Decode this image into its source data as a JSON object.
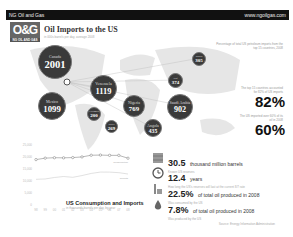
{
  "header": {
    "brand": "NG Oil and Gas",
    "url": "www.ngoilgas.com",
    "logo": "O&G",
    "logo_sub": "NG OIL AND GAS",
    "title": "Oil Imports to the US",
    "subtitle": "in 000s barrels per day, average 2008"
  },
  "map": {
    "note": "Percentage of total US petroleum imports from the top 15 countries, 2008",
    "bubbles": [
      {
        "country": "Canada",
        "value": 2001,
        "x": 28,
        "y": 5,
        "size": 34
      },
      {
        "country": "Venezuela",
        "value": 1119,
        "x": 80,
        "y": 35,
        "size": 27
      },
      {
        "country": "Mexico",
        "value": 1099,
        "x": 28,
        "y": 52,
        "size": 28
      },
      {
        "country": "Colombia",
        "value": 200,
        "x": 77,
        "y": 67,
        "size": 14
      },
      {
        "country": "Brazil",
        "value": 269,
        "x": 95,
        "y": 80,
        "size": 13
      },
      {
        "country": "Nigeria",
        "value": 769,
        "x": 113,
        "y": 55,
        "size": 22
      },
      {
        "country": "Angola",
        "value": 435,
        "x": 134,
        "y": 79,
        "size": 18
      },
      {
        "country": "Saudi Arabia",
        "value": 902,
        "x": 157,
        "y": 54,
        "size": 26
      },
      {
        "country": "Iraq",
        "value": 374,
        "x": 158,
        "y": 33,
        "size": 15
      },
      {
        "country": "Russia",
        "value": 305,
        "x": 182,
        "y": 12,
        "size": 14
      }
    ]
  },
  "stats_right": [
    {
      "label": "The top 15 countries accounted for 82% of US imports",
      "value": "82%"
    },
    {
      "label": "The US imported over 60% of its oil in 2008",
      "value": "60%"
    }
  ],
  "chart_data": {
    "type": "line",
    "title": "US Consumption and Imports",
    "subtitle": "in thousands barrels per day, by year",
    "x": [
      "98",
      "99",
      "00",
      "01",
      "02",
      "03",
      "04",
      "05",
      "06",
      "07",
      "08"
    ],
    "yticks": [
      0,
      5000,
      10000,
      15000,
      20000,
      25000
    ],
    "ylim": [
      0,
      25000
    ],
    "series": [
      {
        "name": "Consumption",
        "values": [
          18917,
          19519,
          19701,
          19649,
          19761,
          20034,
          20731,
          20802,
          20687,
          20680,
          19498
        ]
      },
      {
        "name": "Imports",
        "values": [
          10708,
          10852,
          11459,
          11871,
          11530,
          12264,
          13145,
          13714,
          13707,
          13468,
          12915
        ]
      }
    ]
  },
  "stats": [
    {
      "icon": "barrels-icon",
      "big": "30.5",
      "unit": "thousand million barrels",
      "desc": "Known US reserves"
    },
    {
      "icon": "clock-icon",
      "big": "12.4",
      "unit": "years",
      "desc": "How long the US's reserves will last at the current 8/7 rate"
    },
    {
      "icon": "refinery-icon",
      "big": "22.5%",
      "unit": "of total oil produced in 2008",
      "desc": "Was consumed by the US"
    },
    {
      "icon": "drop-icon",
      "big": "7.8%",
      "unit": "of total oil produced in 2008",
      "desc": "Was produced by the US"
    }
  ],
  "footer": {
    "source": "Source: Energy Information Administration"
  }
}
